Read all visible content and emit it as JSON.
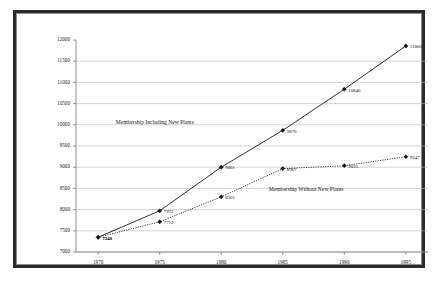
{
  "chart_data": {
    "type": "line",
    "title": "",
    "xlabel": "",
    "ylabel": "",
    "x": [
      1970,
      1975,
      1980,
      1985,
      1990,
      1995
    ],
    "categories": [
      "1970",
      "1975",
      "1980",
      "1985",
      "1990",
      "1995"
    ],
    "xlim": [
      1968.2,
      1996.8
    ],
    "ylim": [
      7000,
      12000
    ],
    "ytick_labels": [
      "7000",
      "7500",
      "8000",
      "8500",
      "9000",
      "9500",
      "10000",
      "10500",
      "11000",
      "11500",
      "12000"
    ],
    "ytick_values": [
      7000,
      7500,
      8000,
      8500,
      9000,
      9500,
      10000,
      10500,
      11000,
      11500,
      12000
    ],
    "grid": true,
    "legend_position": "inline-annotations",
    "series": [
      {
        "name": "Membership Including New Plants",
        "style": "solid",
        "marker": "diamond",
        "values": [
          7348,
          7972,
          9001,
          9870,
          10840,
          11860
        ],
        "point_labels": [
          "7348",
          "7972",
          "9001",
          "9870",
          "10840",
          "11860"
        ]
      },
      {
        "name": "Membership Without New Plants",
        "style": "dotted",
        "marker": "diamond",
        "values": [
          7348,
          7712,
          8301,
          8967,
          9035,
          9247
        ],
        "point_labels": [
          "7348",
          "7712",
          "8301",
          "8967",
          "9035",
          "9247"
        ]
      }
    ],
    "annotations": [
      {
        "text": "Membership Including New Plants",
        "x": 1974.6,
        "y": 10060
      },
      {
        "text": "Membership Without New Plants",
        "x": 1986.9,
        "y": 8460
      }
    ],
    "colors": {
      "line": "#1a1a1a",
      "grid": "#b9b9b9",
      "axis": "#7a7a7a",
      "frame": "#2b2b2b",
      "background": "#ffffff",
      "text": "#1a1a1a"
    }
  }
}
